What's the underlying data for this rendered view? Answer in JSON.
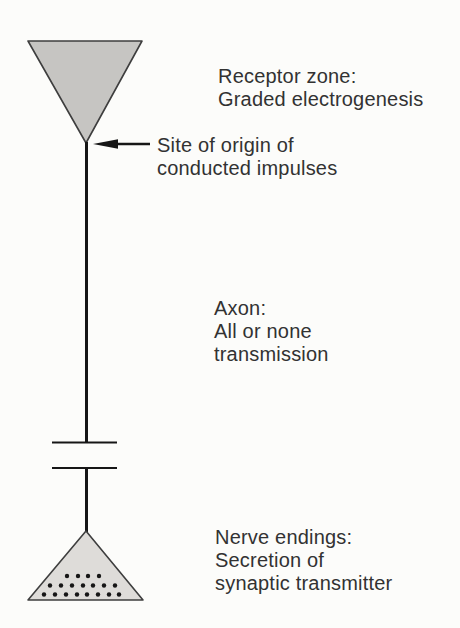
{
  "figure": {
    "labels": {
      "receptor": {
        "line1": "Receptor zone:",
        "line2": "Graded electrogenesis"
      },
      "origin": {
        "line1": "Site of origin of",
        "line2": "conducted impulses"
      },
      "axon": {
        "line1": "Axon:",
        "line2": "All or none",
        "line3": "transmission"
      },
      "nerve": {
        "line1": "Nerve endings:",
        "line2": "Secretion of",
        "line3": "synaptic transmitter"
      }
    },
    "colors": {
      "background": "#fcfcfa",
      "receptor_fill": "#c6c5c2",
      "terminal_fill": "#dedcd9",
      "outline": "#3e3e3e",
      "axon_line": "#161616",
      "text": "#323232"
    },
    "vesicle_dots": {
      "radius": 2.2,
      "rows": [
        {
          "y": 576,
          "xs": [
            67,
            78,
            88,
            99
          ]
        },
        {
          "y": 585.5,
          "xs": [
            50,
            61,
            72,
            83,
            93,
            104,
            115
          ]
        },
        {
          "y": 594.5,
          "xs": [
            44,
            55,
            66,
            77,
            87,
            98,
            109,
            119
          ]
        }
      ]
    }
  }
}
